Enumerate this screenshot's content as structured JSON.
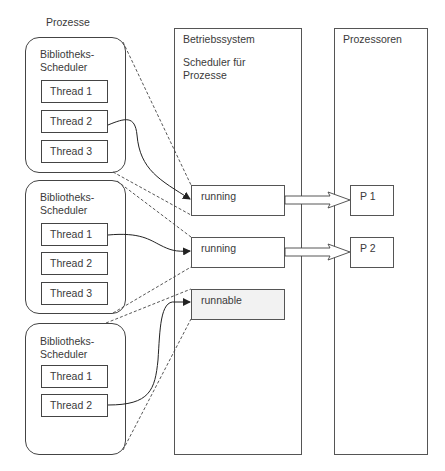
{
  "diagram": {
    "labels": {
      "processes": "Prozesse",
      "os": "Betriebssystem",
      "os_scheduler": "Scheduler für\nProzesse",
      "processors": "Prozessoren"
    },
    "processes": [
      {
        "scheduler": "Bibliotheks-\nScheduler",
        "threads": [
          "Thread 1",
          "Thread 2",
          "Thread 3"
        ]
      },
      {
        "scheduler": "Bibliotheks-\nScheduler",
        "threads": [
          "Thread 1",
          "Thread 2",
          "Thread 3"
        ]
      },
      {
        "scheduler": "Bibliotheks-\nScheduler",
        "threads": [
          "Thread 1",
          "Thread 2"
        ]
      }
    ],
    "os_states": [
      "running",
      "running",
      "runnable"
    ],
    "cpus": [
      "P 1",
      "P 2"
    ],
    "edges": [
      {
        "from": "process1.thread2",
        "to": "os_state1",
        "style": "solid-arrow"
      },
      {
        "from": "process2.thread1",
        "to": "os_state2",
        "style": "solid-arrow"
      },
      {
        "from": "process3.thread2",
        "to": "os_state3",
        "style": "solid-arrow"
      },
      {
        "from": "os_state1",
        "to": "cpu1",
        "style": "block-arrow"
      },
      {
        "from": "os_state2",
        "to": "cpu2",
        "style": "block-arrow"
      },
      {
        "from": "process1",
        "to": "os_state1",
        "style": "dashed"
      },
      {
        "from": "process2",
        "to": "os_state2",
        "style": "dashed"
      },
      {
        "from": "process3",
        "to": "os_state3",
        "style": "dashed"
      }
    ],
    "colors": {
      "line": "#444444",
      "runnable_fill": "#f2f2f2",
      "background": "#ffffff"
    }
  }
}
